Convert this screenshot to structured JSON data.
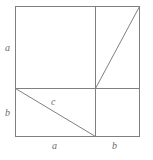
{
  "figure": {
    "background_color": "#ffffff",
    "stroke_color": "#808080",
    "label_color": "#6b6b6b",
    "labels": {
      "a_left": "a",
      "b_left": "b",
      "c_hypotenuse": "c",
      "a_bottom": "a",
      "b_bottom": "b"
    },
    "geometry": {
      "square": {
        "x": 15,
        "y": 6,
        "width": 125,
        "height": 131
      },
      "horizontal_divider_y": 88,
      "vertical_divider_x": 95,
      "diagonal_c": {
        "x1": 15,
        "y1": 88,
        "x2": 95,
        "y2": 137
      },
      "diagonal_upper_right": {
        "x1": 95,
        "y1": 88,
        "x2": 140,
        "y2": 6
      }
    }
  }
}
